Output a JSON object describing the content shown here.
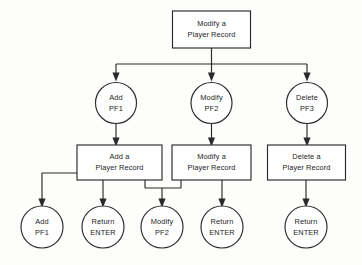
{
  "diagram": {
    "type": "flowchart",
    "canvas": {
      "width": 362,
      "height": 265
    },
    "colors": {
      "background": "#fdfdfb",
      "stroke": "#2a2a2a",
      "fill": "#ffffff",
      "text": "#1c1c1c"
    },
    "nodes": [
      {
        "id": "root",
        "shape": "box",
        "line1": "Modify a",
        "line2": "Player Record",
        "x": 211.5,
        "y": 29.5,
        "w": 78,
        "h": 37
      },
      {
        "id": "pf1-menu",
        "shape": "circle",
        "line1": "Add",
        "line2": "PF1",
        "x": 116,
        "y": 103,
        "r": 20.5
      },
      {
        "id": "pf2-menu",
        "shape": "circle",
        "line1": "Modify",
        "line2": "PF2",
        "x": 211.5,
        "y": 103,
        "r": 20.5
      },
      {
        "id": "pf3-menu",
        "shape": "circle",
        "line1": "Delete",
        "line2": "PF3",
        "x": 307,
        "y": 103,
        "r": 20.5
      },
      {
        "id": "add-box",
        "shape": "box",
        "line1": "Add a",
        "line2": "Player Record",
        "x": 119.5,
        "y": 162.5,
        "w": 85,
        "h": 35
      },
      {
        "id": "modify-box",
        "shape": "box",
        "line1": "Modify a",
        "line2": "Player Record",
        "x": 211.5,
        "y": 162.5,
        "w": 79,
        "h": 35
      },
      {
        "id": "delete-box",
        "shape": "box",
        "line1": "Delete a",
        "line2": "Player Record",
        "x": 306.5,
        "y": 162.5,
        "w": 78,
        "h": 35
      },
      {
        "id": "add-pf1-leaf",
        "shape": "circle",
        "line1": "Add",
        "line2": "PF1",
        "x": 42,
        "y": 227,
        "r": 21
      },
      {
        "id": "return-enter-1",
        "shape": "circle",
        "line1": "Return",
        "line2": "ENTER",
        "x": 103,
        "y": 227,
        "r": 21
      },
      {
        "id": "modify-pf2-leaf",
        "shape": "circle",
        "line1": "Modify",
        "line2": "PF2",
        "x": 162,
        "y": 227,
        "r": 21
      },
      {
        "id": "return-enter-2",
        "shape": "circle",
        "line1": "Return",
        "line2": "ENTER",
        "x": 222,
        "y": 227,
        "r": 21
      },
      {
        "id": "return-enter-3",
        "shape": "circle",
        "line1": "Return",
        "line2": "ENTER",
        "x": 306,
        "y": 227,
        "r": 21
      }
    ],
    "connectors": [
      {
        "id": "root-to-bus",
        "from": "root",
        "to": "bus-1",
        "path": "M 211.5 48 L 211.5 64"
      },
      {
        "id": "bus-1",
        "from": "root",
        "to": "menu-row",
        "path": "M 116 64 L 307 64"
      },
      {
        "id": "bus-to-pf1",
        "from": "bus-1",
        "to": "pf1-menu",
        "path": "M 116 64 L 116 76.5",
        "arrow": "down"
      },
      {
        "id": "bus-to-pf2",
        "from": "bus-1",
        "to": "pf2-menu",
        "path": "M 211.5 64 L 211.5 76.5",
        "arrow": "down"
      },
      {
        "id": "bus-to-pf3",
        "from": "bus-1",
        "to": "pf3-menu",
        "path": "M 307 64 L 307 76.5",
        "arrow": "down"
      },
      {
        "id": "pf1-to-add-box",
        "from": "pf1-menu",
        "to": "add-box",
        "path": "M 116 123.5 L 116 145",
        "arrow": "down"
      },
      {
        "id": "pf2-to-modify-box",
        "from": "pf2-menu",
        "to": "modify-box",
        "path": "M 211.5 123.5 L 211.5 145",
        "arrow": "down"
      },
      {
        "id": "pf3-to-delete-box",
        "from": "pf3-menu",
        "to": "delete-box",
        "path": "M 307 123.5 L 307 145",
        "arrow": "down"
      },
      {
        "id": "add-box-to-add-pf1",
        "from": "add-box",
        "to": "add-pf1-leaf",
        "path": "M 77 173 L 42 173 L 42 206",
        "arrow": "down"
      },
      {
        "id": "add-box-to-return1",
        "from": "add-box",
        "to": "return-enter-1",
        "path": "M 103 180 L 103 206",
        "arrow": "down"
      },
      {
        "id": "add-box-down-right",
        "from": "add-box",
        "to": "join-bus",
        "path": "M 145 180 L 145 188"
      },
      {
        "id": "modify-box-down-left",
        "from": "modify-box",
        "to": "join-bus",
        "path": "M 181 180 L 181 188"
      },
      {
        "id": "join-bus",
        "from": "add-box",
        "to": "modify-pf2-leaf",
        "path": "M 145 188 L 181 188"
      },
      {
        "id": "join-to-modify-pf2",
        "from": "join-bus",
        "to": "modify-pf2-leaf",
        "path": "M 162 188 L 162 206",
        "arrow": "down"
      },
      {
        "id": "modify-box-to-return2",
        "from": "modify-box",
        "to": "return-enter-2",
        "path": "M 222 180 L 222 206",
        "arrow": "down"
      },
      {
        "id": "delete-box-to-return3",
        "from": "delete-box",
        "to": "return-enter-3",
        "path": "M 306 180 L 306 206",
        "arrow": "down"
      }
    ]
  }
}
